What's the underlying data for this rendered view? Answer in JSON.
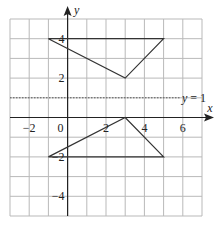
{
  "diagram": {
    "type": "coordinate-grid",
    "x_range": [
      -3,
      7
    ],
    "y_range": [
      -5,
      5
    ],
    "axis_labels": {
      "x": "x",
      "y": "y"
    },
    "x_ticks": [
      {
        "value": -2,
        "label": "−2"
      },
      {
        "value": 0,
        "label": "0"
      },
      {
        "value": 2,
        "label": "2"
      },
      {
        "value": 4,
        "label": "4"
      },
      {
        "value": 6,
        "label": "6"
      }
    ],
    "y_ticks": [
      {
        "value": 4,
        "label": "4"
      },
      {
        "value": 2,
        "label": "2"
      },
      {
        "value": -2,
        "label": "−2"
      },
      {
        "value": -4,
        "label": "−4"
      }
    ],
    "mirror_line": {
      "equation": "y = 1",
      "label_y": "y",
      "label_eq": "= 1",
      "y": 1
    },
    "shapes": [
      {
        "name": "triangle-upper",
        "vertices": [
          [
            -1,
            4
          ],
          [
            5,
            4
          ],
          [
            3,
            2
          ]
        ]
      },
      {
        "name": "triangle-lower",
        "vertices": [
          [
            -1,
            -2
          ],
          [
            5,
            -2
          ],
          [
            3,
            0
          ]
        ]
      }
    ],
    "colors": {
      "grid": "#b9b9b9",
      "axis": "#222222",
      "shape": "#333333",
      "mirror": "#555555"
    }
  }
}
